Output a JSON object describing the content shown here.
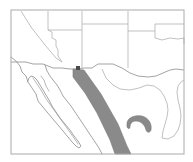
{
  "figure": {
    "kind": "reference-map",
    "region_title": "Southwestern United States and Northwestern Mexico",
    "width": 193,
    "height": 162,
    "background_color": "#ffffff"
  },
  "colors": {
    "frame": "#aaaaaa",
    "boundary_line": "#999999",
    "coastline": "#8d8d8d",
    "state_line": "#a6a6a6",
    "range_fill": "#8a8a8a",
    "range_stroke": "#7b7b7b",
    "highlight_fill": "#8a8a8a",
    "marker_fill": "#4a4a4a",
    "land_fill": "#ffffff",
    "water_fill": "#ffffff"
  },
  "frame": {
    "name": "map-border-frame",
    "x": 11,
    "y": 10,
    "width": 173,
    "height": 144,
    "stroke_width": 1
  },
  "features": {
    "mountain_range": {
      "label": "Sierra Madre Occidental",
      "shape": "diagonal-band",
      "fill": "#8a8a8a",
      "path": "M 73 69 L 84 70 L 101 94 L 118 124 L 127 146 L 131 154 L 115 154 L 110 140 L 97 113 L 85 93 L 73 77 Z"
    },
    "highlight_patch": {
      "label": "study-area-crescent",
      "shape": "crescent",
      "fill": "#8a8a8a",
      "path": "M 127 123 C 128 117 135 115 142 116 C 149 118 152 124 151 130 C 150 133 147 133 146 130 C 145 125 141 121 136 121 C 132 121 130 124 130 127 C 130 129 128 129 127 127 Z"
    },
    "site_marker": {
      "label": "site-marker",
      "shape": "square",
      "x": 76,
      "y": 66,
      "size": 4,
      "fill": "#4a4a4a"
    }
  },
  "geography": {
    "country_boundary": {
      "name": "us-mexico-border",
      "path": "M 11 62 L 26 62 L 33 64 L 43 64 L 48 66 L 53 68 L 62 68 L 70 69 L 78 69 L 84 68 L 92 68 L 98 64 L 106 64 L 113 64 L 122 68 L 130 73 L 138 76 L 148 77 L 156 76 L 163 73 L 170 70 L 176 69 L 184 70"
    },
    "state_lines": [
      {
        "name": "california-nevada-diagonal",
        "path": "M 21 11 L 31 27 L 45 45 L 56 58 L 62 62"
      },
      {
        "name": "nevada-utah-line",
        "path": "M 48 11 L 48 30"
      },
      {
        "name": "nevada-arizona-line",
        "path": "M 48 30 L 52 32 L 52 38 L 56 40 L 56 46 L 58 50 L 58 56 L 62 62"
      },
      {
        "name": "utah-arizona-line",
        "path": "M 48 30 L 82 30"
      },
      {
        "name": "arizona-new-mexico-line",
        "path": "M 82 11 L 82 68"
      },
      {
        "name": "utah-colorado-line",
        "path": "M 82 24 L 128 24"
      },
      {
        "name": "colorado-new-mexico-line",
        "path": "M 128 11 L 128 31 L 128 38"
      },
      {
        "name": "new-mexico-east-line",
        "path": "M 128 38 L 128 68"
      },
      {
        "name": "colorado-oklahoma-line",
        "path": "M 128 31 L 155 31"
      },
      {
        "name": "oklahoma-panhandle-line",
        "path": "M 155 31 L 155 24 L 184 24"
      },
      {
        "name": "texas-panhandle-south",
        "path": "M 155 38 L 162 40 L 170 38 L 178 39 L 184 38"
      },
      {
        "name": "texas-west-line",
        "path": "M 155 31 L 155 38"
      },
      {
        "name": "texas-east-line",
        "path": "M 184 38 L 184 44"
      }
    ],
    "coastlines": [
      {
        "name": "california-pacific-coast",
        "path": "M 11 57 L 16 61 L 20 66 L 22 72 L 26 76 L 28 82"
      },
      {
        "name": "baja-peninsula-outline",
        "path": "M 28 82 L 32 88 L 36 94 L 38 101 L 42 106 L 47 112 L 52 118 L 58 125 L 63 131 L 68 137 L 72 142 L 76 146 L 79 148 L 81 146 L 78 141 L 74 136 L 70 130 L 65 124 L 60 118 L 56 112 L 52 106 L 49 100 L 46 95 L 43 90 L 40 85 L 37 80 L 34 77 L 31 76 L 29 78 Z"
      },
      {
        "name": "gulf-of-california-mainland-coast",
        "path": "M 45 65 L 47 71 L 50 76 L 53 80 L 57 85 L 60 90 L 63 96 L 67 101 L 71 106 L 75 112 L 79 118 L 83 124 L 87 130 L 91 136 L 95 142 L 99 148 L 102 154"
      },
      {
        "name": "sonora-inner-bay",
        "path": "M 41 76 L 44 80 L 46 86 L 49 91"
      },
      {
        "name": "baja-inner-gulf-shore",
        "path": "M 33 78 L 37 84 L 41 90 L 45 97 L 49 103 L 54 110 L 59 117 L 64 124 L 69 131 L 74 138 L 78 144"
      }
    ],
    "mexico_state_lines": [
      {
        "name": "sonora-chihuahua-line",
        "path": "M 102 69 L 106 78 L 113 85 L 120 89 L 130 90 L 139 88 L 147 85 L 154 86 L 160 90 L 164 96 L 167 103 L 168 110 L 167 117 L 165 124 L 163 131 L 162 138"
      },
      {
        "name": "chihuahua-coahuila-line",
        "path": "M 162 138 L 168 139 L 174 136 L 178 130 L 180 124 L 181 116 L 180 108 L 178 100 L 177 92 L 178 86 L 181 82 L 184 80"
      }
    ]
  },
  "annotations": {
    "has_scale_bar": false,
    "has_north_arrow": false,
    "has_legend": false,
    "has_labels": false
  }
}
